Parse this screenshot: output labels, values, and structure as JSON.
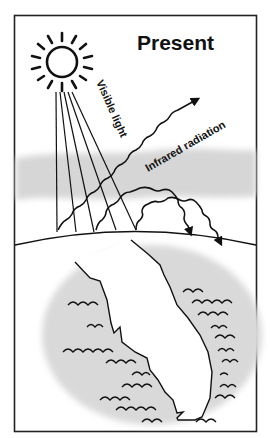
{
  "diagram": {
    "title": "Present",
    "labels": {
      "visible_light": "Visible light",
      "infrared_radiation": "Infrared radiation"
    },
    "colors": {
      "ink": "#111111",
      "atmosphere_band": "#d6d6d6",
      "water_halo": "#d9d9d9",
      "background": "#ffffff"
    },
    "elements": [
      "sun",
      "visible-light-rays",
      "atmosphere-band",
      "infrared-radiation-escaping",
      "infrared-radiation-reflected",
      "earth-horizon",
      "peninsula-landmass",
      "ocean-waves"
    ]
  }
}
